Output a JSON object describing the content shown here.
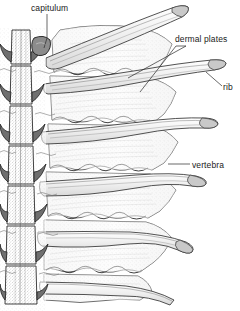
{
  "figure": {
    "kind": "scientific-line-illustration",
    "width": 240,
    "height": 311,
    "background_color": "#ffffff",
    "ink_color": "#1a1a1a",
    "shading_color": "#9a9a9a",
    "stipple_color": "#b9b9b9"
  },
  "labels": [
    {
      "id": "capitulum",
      "text": "capitulum",
      "x": 31,
      "y": 3,
      "leader": "vertical-down-right"
    },
    {
      "id": "dermal-plates",
      "text": "dermal plates",
      "x": 175,
      "y": 34,
      "leader": "two-crossing-lines-down-left"
    },
    {
      "id": "rib",
      "text": "rib",
      "x": 223,
      "y": 82,
      "leader": "short-diagonal-up-left"
    },
    {
      "id": "vertebra",
      "text": "vertebra",
      "x": 192,
      "y": 160,
      "leader": "horizontal-dash-left"
    }
  ],
  "caption": {
    "text": "",
    "visible": false
  },
  "anatomy": {
    "vertebral_column": {
      "name": "vertebral column",
      "position": "left margin",
      "segment_count": 7,
      "description": "stacked centra with lateral neural processes"
    },
    "ribs": {
      "name": "ribs",
      "count": 5,
      "description": "tapered elongate elements radiating to the right"
    },
    "dermal_plates": {
      "name": "dermal plates",
      "count": 5,
      "description": "broad plates with zigzag sutured margins and radiating hatching"
    }
  }
}
